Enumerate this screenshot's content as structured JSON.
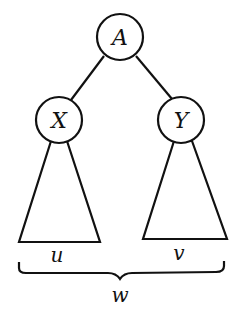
{
  "diagram": {
    "type": "binary-tree-subtree-schematic",
    "nodes": [
      {
        "id": "A",
        "label": "A",
        "cx": 120,
        "cy": 37,
        "r": 23
      },
      {
        "id": "X",
        "label": "X",
        "cx": 59,
        "cy": 120,
        "r": 23
      },
      {
        "id": "Y",
        "label": "Y",
        "cx": 181,
        "cy": 120,
        "r": 23
      }
    ],
    "edges": [
      {
        "from": "A",
        "to": "X"
      },
      {
        "from": "A",
        "to": "Y"
      }
    ],
    "subtrees": [
      {
        "parent": "X",
        "label": "u"
      },
      {
        "parent": "Y",
        "label": "v"
      }
    ],
    "brace": {
      "spans": [
        "u",
        "v"
      ],
      "label": "w"
    },
    "colors": {
      "stroke": "#111111",
      "background": "#ffffff"
    }
  }
}
